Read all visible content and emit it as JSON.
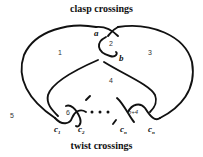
{
  "diagram": {
    "title_top": "clasp crossings",
    "title_bottom": "twist crossings",
    "clasp_labels": [
      "a",
      "b"
    ],
    "region_labels": [
      "1",
      "2",
      "3",
      "4",
      "5",
      "6",
      "n+4"
    ],
    "twist_labels": [
      {
        "base": "c",
        "sub": "1"
      },
      {
        "base": "c",
        "sub": "2"
      },
      {
        "base": "c",
        "sub": "n"
      },
      {
        "base": "c",
        "sub": "n"
      }
    ],
    "ellipsis": "• • •"
  }
}
